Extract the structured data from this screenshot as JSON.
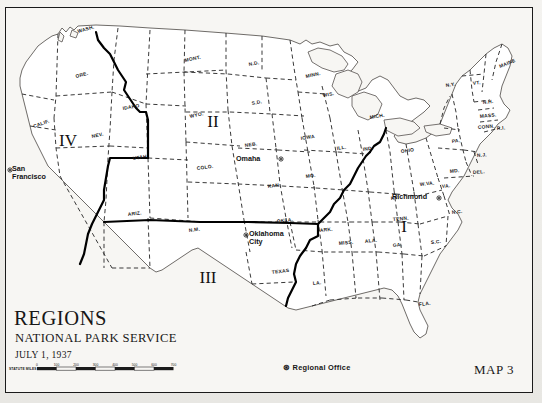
{
  "map": {
    "title": "REGIONS",
    "agency": "NATIONAL PARK SERVICE",
    "date": "JULY 1, 1937",
    "map_number": "MAP 3",
    "legend_symbol": "⊛",
    "legend_label": "Regional Office",
    "scale_label": "STATUTE MILES",
    "scale_ticks": [
      "0",
      "100",
      "200",
      "300",
      "400",
      "500",
      "600",
      "700"
    ],
    "colors": {
      "paper": "#f2f1ee",
      "frame": "#1a1a1a",
      "coastline": "#4a4a4a",
      "state_border": "#2b2b2b",
      "region_border": "#000000",
      "text": "#171717"
    }
  },
  "regions": [
    {
      "numeral": "I",
      "x": 404,
      "y": 232
    },
    {
      "numeral": "II",
      "x": 213,
      "y": 127
    },
    {
      "numeral": "III",
      "x": 208,
      "y": 283
    },
    {
      "numeral": "IV",
      "x": 68,
      "y": 146
    }
  ],
  "regional_offices": [
    {
      "name": "San Francisco",
      "x": 12,
      "y": 171,
      "label_lines": [
        "San",
        "Francisco"
      ],
      "dot_x": 10,
      "dot_y": 170
    },
    {
      "name": "Omaha",
      "x": 236,
      "y": 161,
      "label_lines": [
        "Omaha"
      ],
      "dot_x": 281,
      "dot_y": 159
    },
    {
      "name": "Oklahoma City",
      "x": 249,
      "y": 236,
      "label_lines": [
        "Oklahoma",
        "City"
      ],
      "dot_x": 246,
      "dot_y": 235
    },
    {
      "name": "Richmond",
      "x": 392,
      "y": 199,
      "label_lines": [
        "Richmond"
      ],
      "dot_x": 439,
      "dot_y": 198
    }
  ],
  "states": [
    {
      "abbr": "WASH.",
      "x": 78,
      "y": 33,
      "rot": -16
    },
    {
      "abbr": "ORE.",
      "x": 76,
      "y": 78,
      "rot": -15
    },
    {
      "abbr": "CALIF.",
      "x": 34,
      "y": 128,
      "rot": -20
    },
    {
      "abbr": "NEV.",
      "x": 92,
      "y": 138,
      "rot": -12
    },
    {
      "abbr": "IDAHO",
      "x": 123,
      "y": 110,
      "rot": -10
    },
    {
      "abbr": "MONT.",
      "x": 185,
      "y": 62,
      "rot": -12
    },
    {
      "abbr": "WYO.",
      "x": 190,
      "y": 118,
      "rot": -12
    },
    {
      "abbr": "UTAH",
      "x": 133,
      "y": 160,
      "rot": -8
    },
    {
      "abbr": "ARIZ.",
      "x": 128,
      "y": 216,
      "rot": -7
    },
    {
      "abbr": "N.M.",
      "x": 189,
      "y": 232,
      "rot": -7
    },
    {
      "abbr": "COLO.",
      "x": 197,
      "y": 170,
      "rot": -8
    },
    {
      "abbr": "N.D.",
      "x": 249,
      "y": 66,
      "rot": -10
    },
    {
      "abbr": "S.D.",
      "x": 252,
      "y": 105,
      "rot": -10
    },
    {
      "abbr": "NEB.",
      "x": 245,
      "y": 147,
      "rot": -8
    },
    {
      "abbr": "KAN.",
      "x": 268,
      "y": 188,
      "rot": -7
    },
    {
      "abbr": "OKLA.",
      "x": 277,
      "y": 223,
      "rot": -7
    },
    {
      "abbr": "TEXAS",
      "x": 272,
      "y": 274,
      "rot": -7
    },
    {
      "abbr": "MINN.",
      "x": 306,
      "y": 78,
      "rot": -12
    },
    {
      "abbr": "WIS.",
      "x": 323,
      "y": 97,
      "rot": -10
    },
    {
      "abbr": "IOWA",
      "x": 301,
      "y": 140,
      "rot": -9
    },
    {
      "abbr": "MO.",
      "x": 306,
      "y": 178,
      "rot": -8
    },
    {
      "abbr": "ARK.",
      "x": 320,
      "y": 232,
      "rot": -6
    },
    {
      "abbr": "LA.",
      "x": 313,
      "y": 285,
      "rot": -6
    },
    {
      "abbr": "MISS.",
      "x": 339,
      "y": 245,
      "rot": -6
    },
    {
      "abbr": "ALA.",
      "x": 365,
      "y": 243,
      "rot": -6
    },
    {
      "abbr": "ILL.",
      "x": 337,
      "y": 150,
      "rot": -8
    },
    {
      "abbr": "IND.",
      "x": 363,
      "y": 151,
      "rot": -8
    },
    {
      "abbr": "MICH.",
      "x": 370,
      "y": 119,
      "rot": -9
    },
    {
      "abbr": "OHIO",
      "x": 401,
      "y": 153,
      "rot": -7
    },
    {
      "abbr": "KY.",
      "x": 391,
      "y": 200,
      "rot": -6
    },
    {
      "abbr": "TENN.",
      "x": 393,
      "y": 221,
      "rot": -5
    },
    {
      "abbr": "GA.",
      "x": 393,
      "y": 247,
      "rot": -6
    },
    {
      "abbr": "FLA.",
      "x": 419,
      "y": 306,
      "rot": -6
    },
    {
      "abbr": "S.C.",
      "x": 431,
      "y": 244,
      "rot": -6
    },
    {
      "abbr": "N.C.",
      "x": 452,
      "y": 214,
      "rot": -6
    },
    {
      "abbr": "W.VA.",
      "x": 420,
      "y": 186,
      "rot": -6
    },
    {
      "abbr": "VA.",
      "x": 442,
      "y": 188,
      "rot": -6
    },
    {
      "abbr": "MD.",
      "x": 450,
      "y": 173,
      "rot": -6
    },
    {
      "abbr": "DEL.",
      "x": 473,
      "y": 174,
      "rot": -4
    },
    {
      "abbr": "PA.",
      "x": 452,
      "y": 143,
      "rot": -7
    },
    {
      "abbr": "N.J.",
      "x": 477,
      "y": 157,
      "rot": -4
    },
    {
      "abbr": "N.Y.",
      "x": 446,
      "y": 87,
      "rot": -9
    },
    {
      "abbr": "VT.",
      "x": 473,
      "y": 85,
      "rot": -7
    },
    {
      "abbr": "N.H.",
      "x": 483,
      "y": 104,
      "rot": -6
    },
    {
      "abbr": "MASS.",
      "x": 480,
      "y": 118,
      "rot": -6
    },
    {
      "abbr": "CONN.",
      "x": 478,
      "y": 129,
      "rot": -5
    },
    {
      "abbr": "R.I.",
      "x": 497,
      "y": 130,
      "rot": -5
    },
    {
      "abbr": "MAINE",
      "x": 500,
      "y": 68,
      "rot": -22
    }
  ]
}
